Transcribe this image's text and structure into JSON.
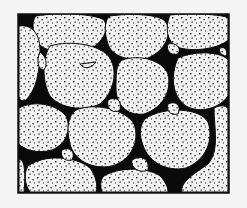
{
  "figure": {
    "background": "#f5f5f5",
    "frame": {
      "x": 18,
      "y": 14,
      "w": 211,
      "h": 179,
      "stroke": "#111111"
    },
    "matrix_color": "#0a0a0a",
    "grain_color": "#f2f2f2",
    "dot_color": "#1a1a1a",
    "grains": [
      {
        "d": "M36,16 C60,12 95,14 104,20 C110,30 102,45 84,52 C62,56 40,50 36,40 C32,30 32,20 36,16 Z"
      },
      {
        "d": "M110,16 C130,13 160,14 166,22 C172,34 166,50 148,58 C128,62 112,56 108,44 C104,32 104,20 110,16 Z"
      },
      {
        "d": "M170,15 C190,13 222,14 228,18 L228,40 C220,48 196,52 180,48 C168,44 164,30 170,15 Z"
      },
      {
        "d": "M19,26 C30,24 40,32 40,50 C40,72 36,90 26,100 C22,102 19,100 19,96 Z"
      },
      {
        "d": "M50,46 C70,40 100,44 110,58 C118,72 114,92 100,104 C82,112 60,108 50,96 C42,82 42,58 50,46 Z"
      },
      {
        "d": "M122,60 C140,54 162,60 168,74 C172,92 162,108 144,114 C126,116 116,104 116,88 C116,74 116,64 122,60 Z"
      },
      {
        "d": "M178,58 C196,50 222,52 228,60 L228,96 C220,108 200,114 186,106 C172,96 170,76 178,58 Z"
      },
      {
        "d": "M19,108 C34,100 56,104 66,116 C72,130 66,144 52,150 C38,154 24,150 19,144 Z"
      },
      {
        "d": "M76,110 C96,102 126,110 134,124 C140,140 132,160 112,166 C92,170 74,160 70,144 C66,128 68,116 76,110 Z"
      },
      {
        "d": "M146,118 C166,106 200,108 208,122 C214,140 206,160 186,168 C166,172 150,162 144,148 C138,134 140,124 146,118 Z"
      },
      {
        "d": "M214,108 C222,104 228,106 228,110 L228,192 L182,192 C180,182 194,174 208,164 C220,150 214,128 214,108 Z"
      },
      {
        "d": "M28,166 C44,154 76,156 90,168 C96,176 98,186 96,192 L30,192 C24,184 24,172 28,166 Z"
      },
      {
        "d": "M104,176 C120,166 150,168 160,176 C166,182 168,188 168,192 L102,192 C100,186 100,180 104,176 Z"
      },
      {
        "d": "M19,160 C24,158 26,170 24,192 L19,192 Z"
      },
      {
        "d": "M96,62 C92,68 84,70 80,64 Z"
      },
      {
        "d": "M40,52 C46,56 48,64 44,70 C38,70 36,60 40,52 Z"
      },
      {
        "d": "M108,100 C116,96 122,100 120,110 C114,114 106,110 108,100 Z"
      },
      {
        "d": "M168,44 C176,42 182,48 178,54 C170,56 166,50 168,44 Z"
      },
      {
        "d": "M62,150 C70,146 76,152 72,160 C64,162 60,156 62,150 Z"
      },
      {
        "d": "M132,160 C142,154 150,160 148,170 C140,174 130,168 132,160 Z"
      },
      {
        "d": "M168,104 C176,100 182,106 178,114 C170,116 166,110 168,104 Z"
      },
      {
        "d": "M220,48 C226,46 228,52 226,56 C222,56 218,52 220,48 Z"
      }
    ]
  }
}
